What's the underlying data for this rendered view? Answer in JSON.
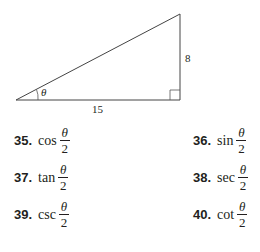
{
  "figure": {
    "angle_label": "θ",
    "adjacent_label": "15",
    "opposite_label": "8"
  },
  "problems": [
    {
      "number": "35.",
      "func": "cos",
      "numerator": "θ",
      "denominator": "2"
    },
    {
      "number": "36.",
      "func": "sin",
      "numerator": "θ",
      "denominator": "2"
    },
    {
      "number": "37.",
      "func": "tan",
      "numerator": "θ",
      "denominator": "2"
    },
    {
      "number": "38.",
      "func": "sec",
      "numerator": "θ",
      "denominator": "2"
    },
    {
      "number": "39.",
      "func": "csc",
      "numerator": "θ",
      "denominator": "2"
    },
    {
      "number": "40.",
      "func": "cot",
      "numerator": "θ",
      "denominator": "2"
    }
  ]
}
